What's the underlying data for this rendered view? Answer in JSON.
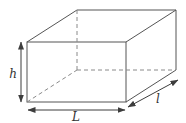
{
  "diagram": {
    "type": "cuboid-dimension-diagram",
    "labels": {
      "height": "h",
      "length": "L",
      "depth": "l"
    },
    "colors": {
      "visible_edge": "#555555",
      "hidden_edge": "#8a8a8a",
      "dimension_arrow": "#3d3d3d",
      "label_text": "#333333",
      "background": "#ffffff"
    },
    "line_styles": {
      "visible_edges": "solid",
      "hidden_edges": "dashed"
    }
  }
}
